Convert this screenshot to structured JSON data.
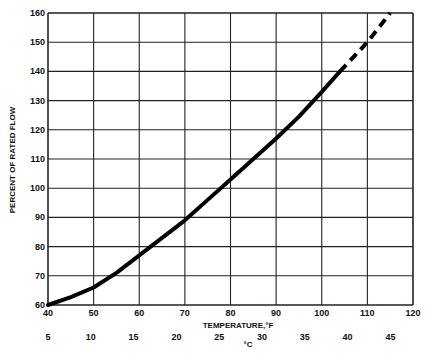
{
  "chart_data": {
    "type": "line",
    "title": "",
    "xlabel": "TEMPERATURE,°F",
    "xlabel2": "°C",
    "ylabel": "PERCENT OF RATED FLOW",
    "xlim": [
      40,
      120
    ],
    "ylim": [
      60,
      160
    ],
    "grid": true,
    "x_ticks": [
      "40",
      "50",
      "60",
      "70",
      "80",
      "90",
      "100",
      "110",
      "120"
    ],
    "y_ticks": [
      "60",
      "70",
      "80",
      "90",
      "100",
      "110",
      "120",
      "130",
      "140",
      "150",
      "160"
    ],
    "celsius_ticks": [
      "5",
      "10",
      "15",
      "20",
      "25",
      "30",
      "35",
      "40",
      "45"
    ],
    "series": [
      {
        "name": "measured",
        "style": "solid",
        "x": [
          40,
          45,
          50,
          55,
          60,
          65,
          70,
          75,
          80,
          85,
          90,
          95,
          100,
          104
        ],
        "y": [
          60,
          62.7,
          66,
          71,
          77,
          83,
          89,
          96,
          103,
          110,
          117,
          124.5,
          133,
          140
        ]
      },
      {
        "name": "extrapolated",
        "style": "dashed",
        "x": [
          104,
          110,
          115
        ],
        "y": [
          140,
          150,
          160
        ]
      }
    ]
  }
}
